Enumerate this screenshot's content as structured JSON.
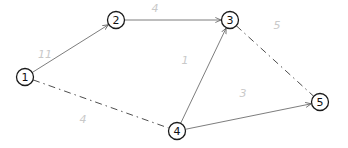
{
  "diagram": {
    "type": "weighted-graph",
    "nodes": [
      {
        "id": "1",
        "label": "1",
        "x": 25,
        "y": 77
      },
      {
        "id": "2",
        "label": "2",
        "x": 116,
        "y": 20
      },
      {
        "id": "3",
        "label": "3",
        "x": 230,
        "y": 20
      },
      {
        "id": "4",
        "label": "4",
        "x": 177,
        "y": 131
      },
      {
        "id": "5",
        "label": "5",
        "x": 320,
        "y": 102
      }
    ],
    "edges": [
      {
        "from": "1",
        "to": "2",
        "style": "solid",
        "directed": true,
        "weight": "11",
        "lx": 45,
        "ly": 54
      },
      {
        "from": "2",
        "to": "3",
        "style": "solid",
        "directed": true,
        "weight": "4",
        "lx": 155,
        "ly": 8
      },
      {
        "from": "4",
        "to": "3",
        "style": "solid",
        "directed": true,
        "weight": "1",
        "lx": 185,
        "ly": 60
      },
      {
        "from": "4",
        "to": "5",
        "style": "solid",
        "directed": true,
        "weight": "3",
        "lx": 243,
        "ly": 93
      },
      {
        "from": "1",
        "to": "4",
        "style": "dashdot",
        "directed": false,
        "weight": "4",
        "lx": 83,
        "ly": 119
      },
      {
        "from": "3",
        "to": "5",
        "style": "dashdot",
        "directed": false,
        "weight": "5",
        "lx": 277,
        "ly": 25
      }
    ]
  },
  "colors": {
    "node_stroke": "#1a1a1a",
    "edge_solid": "#6e6e6e",
    "edge_dashdot": "#3a3a3a",
    "weight_label": "#c9c9c9"
  }
}
